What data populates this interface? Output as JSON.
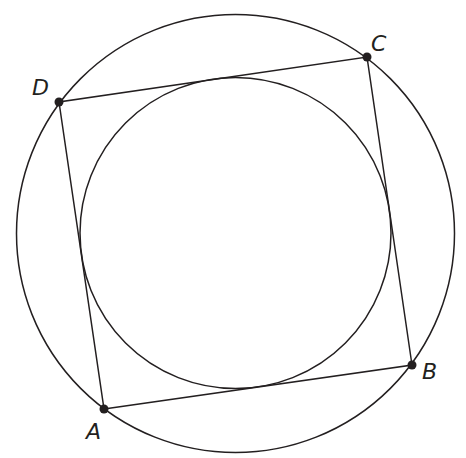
{
  "diagram": {
    "stroke_color": "#231f20",
    "background": "#ffffff",
    "outer_circle": {
      "cx": 235.5,
      "cy": 233.5,
      "r": 219
    },
    "inner_circle": {
      "cx": 235.5,
      "cy": 233,
      "r": 155.5
    },
    "points": [
      {
        "name": "A",
        "label": "A",
        "x": 104,
        "y": 409,
        "label_x": 86,
        "label_y": 421
      },
      {
        "name": "B",
        "label": "B",
        "x": 412,
        "y": 365,
        "label_x": 422,
        "label_y": 361
      },
      {
        "name": "C",
        "label": "C",
        "x": 367,
        "y": 57,
        "label_x": 371,
        "label_y": 33
      },
      {
        "name": "D",
        "label": "D",
        "x": 59,
        "y": 102,
        "label_x": 32,
        "label_y": 77
      }
    ],
    "segments": [
      {
        "from": "A",
        "to": "B"
      },
      {
        "from": "B",
        "to": "C"
      },
      {
        "from": "C",
        "to": "D"
      },
      {
        "from": "D",
        "to": "A"
      }
    ]
  },
  "labels": {
    "A": "A",
    "B": "B",
    "C": "C",
    "D": "D"
  }
}
